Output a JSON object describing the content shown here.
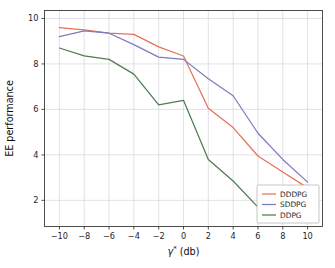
{
  "chart_data": {
    "type": "line",
    "title": "",
    "xlabel": "γ* (db)",
    "xlabel_parts": {
      "symbol": "γ",
      "superscript": "*",
      "unit": " (db)"
    },
    "ylabel": "EE performance",
    "x": [
      -10,
      -8,
      -6,
      -4,
      -2,
      0,
      2,
      4,
      6,
      8,
      10
    ],
    "xlim": [
      -11.2,
      11.2
    ],
    "ylim": [
      0.85,
      10.35
    ],
    "xticks": [
      -10,
      -8,
      -6,
      -4,
      -2,
      0,
      2,
      4,
      6,
      8,
      10
    ],
    "xticklabels": [
      "−10",
      "−8",
      "−6",
      "−4",
      "−2",
      "0",
      "2",
      "4",
      "6",
      "8",
      "10"
    ],
    "yticks": [
      2,
      4,
      6,
      8,
      10
    ],
    "yticklabels": [
      "2",
      "4",
      "6",
      "8",
      "10"
    ],
    "grid": true,
    "legend_position": "lower right",
    "series": [
      {
        "name": "DDDPG",
        "color": "#e8705a",
        "values": [
          9.6,
          9.5,
          9.35,
          9.3,
          8.75,
          8.35,
          6.05,
          5.2,
          3.95,
          3.25,
          2.55
        ]
      },
      {
        "name": "SDDPG",
        "color": "#7c7cc0",
        "values": [
          9.2,
          9.45,
          9.35,
          8.85,
          8.3,
          8.2,
          7.35,
          6.6,
          4.95,
          3.8,
          2.8
        ]
      },
      {
        "name": "DDPG",
        "color": "#4f7d4f",
        "values": [
          8.7,
          8.35,
          8.2,
          7.55,
          6.2,
          6.4,
          3.8,
          2.85,
          1.7,
          1.6,
          1.45
        ]
      }
    ]
  },
  "legend": {
    "entries": [
      {
        "label": "DDDPG"
      },
      {
        "label": "SDDPG"
      },
      {
        "label": "DDPG"
      }
    ]
  },
  "colors": {
    "background": "#ffffff",
    "grid": "#d4d4dc",
    "spine": "#3b3b3b",
    "dddpg": "#e8705a",
    "sddpg": "#7c7cc0",
    "ddpg": "#4f7d4f"
  }
}
